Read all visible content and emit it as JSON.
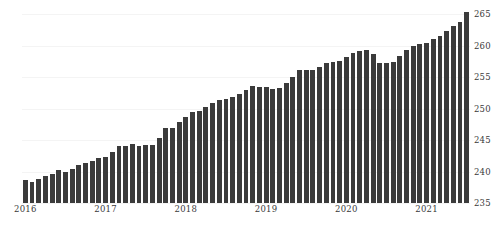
{
  "chart_data": {
    "type": "bar",
    "title": "",
    "subtitle": "",
    "xlabel": "",
    "ylabel": "",
    "ylim": [
      235,
      266
    ],
    "yticks": [
      235,
      240,
      245,
      250,
      255,
      260,
      265
    ],
    "xticks": [
      "2016",
      "2017",
      "2018",
      "2019",
      "2020",
      "2021"
    ],
    "grid": true,
    "legend": "none",
    "bar_color": "#3b3b3b",
    "categories": [
      "2016-01",
      "2016-02",
      "2016-03",
      "2016-04",
      "2016-05",
      "2016-06",
      "2016-07",
      "2016-08",
      "2016-09",
      "2016-10",
      "2016-11",
      "2016-12",
      "2017-01",
      "2017-02",
      "2017-03",
      "2017-04",
      "2017-05",
      "2017-06",
      "2017-07",
      "2017-08",
      "2017-09",
      "2017-10",
      "2017-11",
      "2017-12",
      "2018-01",
      "2018-02",
      "2018-03",
      "2018-04",
      "2018-05",
      "2018-06",
      "2018-07",
      "2018-08",
      "2018-09",
      "2018-10",
      "2018-11",
      "2018-12",
      "2019-01",
      "2019-02",
      "2019-03",
      "2019-04",
      "2019-05",
      "2019-06",
      "2019-07",
      "2019-08",
      "2019-09",
      "2019-10",
      "2019-11",
      "2019-12",
      "2020-01",
      "2020-02",
      "2020-03",
      "2020-04",
      "2020-05",
      "2020-06",
      "2020-07",
      "2020-08",
      "2020-09",
      "2020-10",
      "2020-11",
      "2020-12",
      "2021-01",
      "2021-02",
      "2021-03",
      "2021-04",
      "2021-05",
      "2021-06",
      "2021-07"
    ],
    "values": [
      238.6,
      238.3,
      238.8,
      239.3,
      239.6,
      240.2,
      240.0,
      240.4,
      241.0,
      241.4,
      241.6,
      242.2,
      242.3,
      243.1,
      244.1,
      244.1,
      244.4,
      244.1,
      244.2,
      244.3,
      245.3,
      246.9,
      247.0,
      247.9,
      248.6,
      249.5,
      249.6,
      250.2,
      250.9,
      251.4,
      251.5,
      251.8,
      252.4,
      253.0,
      253.6,
      253.4,
      253.4,
      253.2,
      253.3,
      254.1,
      255.0,
      256.1,
      256.1,
      256.1,
      256.6,
      257.2,
      257.4,
      257.6,
      258.2,
      258.8,
      259.2,
      259.4,
      258.7,
      257.2,
      257.2,
      257.4,
      258.3,
      259.3,
      259.9,
      260.2,
      260.5,
      261.1,
      261.6,
      262.3,
      263.2,
      263.7,
      265.3
    ]
  }
}
